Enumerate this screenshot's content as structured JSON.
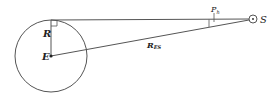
{
  "diagram": {
    "colors": {
      "stroke": "#555555",
      "text": "#222222",
      "background": "#ffffff"
    },
    "labels": {
      "earth_center": "E",
      "earth_radius": "R",
      "sun": "S",
      "distance_main": "R",
      "distance_sub": "ES",
      "parallax_main": "P",
      "parallax_sub": "h"
    },
    "geometry": {
      "earth": {
        "cx": 51,
        "cy": 56,
        "r": 36
      },
      "tangent_point": {
        "x": 51,
        "y": 20
      },
      "sun": {
        "cx": 253,
        "cy": 19,
        "r": 4
      }
    }
  }
}
